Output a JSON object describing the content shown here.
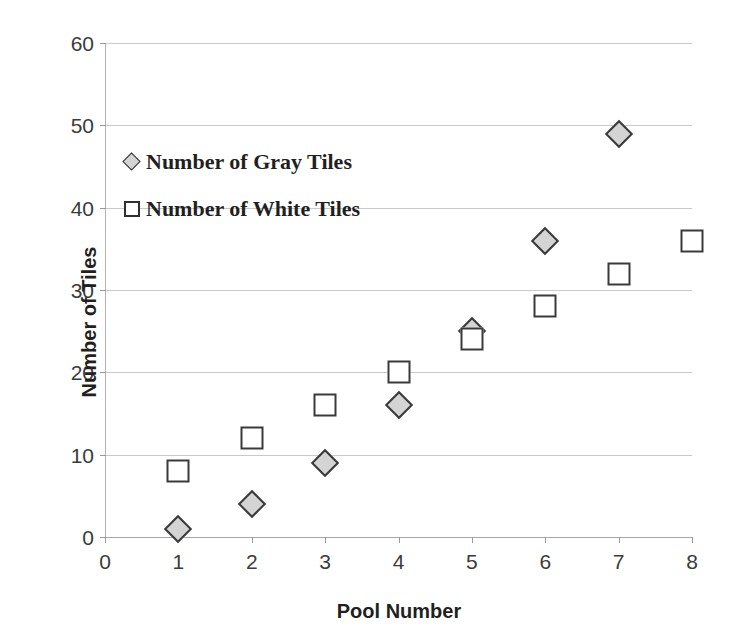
{
  "chart_data": {
    "type": "scatter",
    "title": "",
    "xlabel": "Pool Number",
    "ylabel": "Number of Tiles",
    "xlim": [
      0,
      8
    ],
    "ylim": [
      0,
      60
    ],
    "x_ticks": [
      "0",
      "1",
      "2",
      "3",
      "4",
      "5",
      "6",
      "7",
      "8"
    ],
    "y_ticks": [
      "0",
      "10",
      "20",
      "30",
      "40",
      "50",
      "60"
    ],
    "grid": "horizontal",
    "legend_position": "inside-upper-left",
    "series": [
      {
        "name": "Number of Gray Tiles",
        "marker": "diamond",
        "fill_color": "#d4d4d4",
        "edge_color": "#3a3a3a",
        "x": [
          1,
          2,
          3,
          4,
          5,
          6,
          7
        ],
        "values": [
          1,
          4,
          9,
          16,
          25,
          36,
          49
        ]
      },
      {
        "name": "Number of White Tiles",
        "marker": "square",
        "fill_color": "#ffffff",
        "edge_color": "#3a3a3a",
        "x": [
          1,
          2,
          3,
          4,
          5,
          6,
          7,
          8
        ],
        "values": [
          8,
          12,
          16,
          20,
          24,
          28,
          32,
          36
        ]
      }
    ]
  },
  "legend": {
    "items": [
      {
        "label": "Number of Gray Tiles",
        "marker": "diamond"
      },
      {
        "label": "Number of White Tiles",
        "marker": "square"
      }
    ]
  },
  "colors": {
    "gridline": "#c9c9c9",
    "axis": "#a6a6a6",
    "text": "#231f20",
    "gray_tile_fill": "#d4d4d4",
    "white_tile_fill": "#ffffff",
    "marker_edge": "#3a3a3a"
  }
}
